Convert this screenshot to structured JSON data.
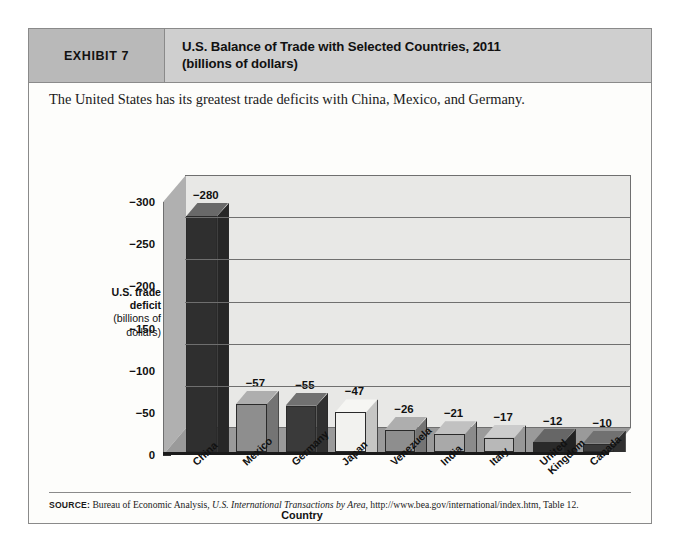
{
  "exhibit": {
    "tag": "EXHIBIT 7",
    "title_line1": "U.S. Balance of Trade with Selected Countries, 2011",
    "title_line2": "(billions of dollars)",
    "caption": "The United States has its greatest trade deficits with China, Mexico, and Germany.",
    "tag_bg": "#b9b9b9",
    "title_bg": "#cfcfcf"
  },
  "axis": {
    "y_title_bold_line1": "U.S. trade",
    "y_title_bold_line2": "deficit",
    "y_title_line3": "(billions of",
    "y_title_line4": "dollars)",
    "x_title": "Country"
  },
  "source": {
    "label": "SOURCE:",
    "text_before": " Bureau of Economic Analysis, ",
    "italic": "U.S. International Transactions by Area",
    "text_after": ", http://www.bea.gov/international/index.htm, Table 12."
  },
  "chart_data": {
    "type": "bar",
    "title": "U.S. Balance of Trade with Selected Countries, 2011 (billions of dollars)",
    "xlabel": "Country",
    "ylabel": "U.S. trade deficit (billions of dollars)",
    "categories": [
      "China",
      "Mexico",
      "Germany",
      "Japan",
      "Venezuela",
      "India",
      "Italy",
      "United Kingdom",
      "Canada"
    ],
    "values": [
      -280,
      -57,
      -55,
      -47,
      -26,
      -21,
      -17,
      -12,
      -10
    ],
    "value_labels": [
      "−280",
      "−57",
      "−55",
      "−47",
      "−26",
      "−21",
      "−17",
      "−12",
      "−10"
    ],
    "bar_colors": [
      "#2f2f2f",
      "#8e8e8e",
      "#3a3a3a",
      "#f2f2ef",
      "#8e8e8e",
      "#a9a9a9",
      "#b8b8b8",
      "#2a2a2a",
      "#3a3a3a"
    ],
    "ylim": [
      -300,
      0
    ],
    "yticks": [
      0,
      -50,
      -100,
      -150,
      -200,
      -250,
      -300
    ],
    "ytick_labels": [
      "0",
      "−50",
      "−100",
      "−150",
      "−200",
      "−250",
      "−300"
    ],
    "grid": true,
    "legend": "none",
    "note": "Axis is inverted: 0 at bottom, -300 at top; bars drawn upward as magnitudes."
  }
}
